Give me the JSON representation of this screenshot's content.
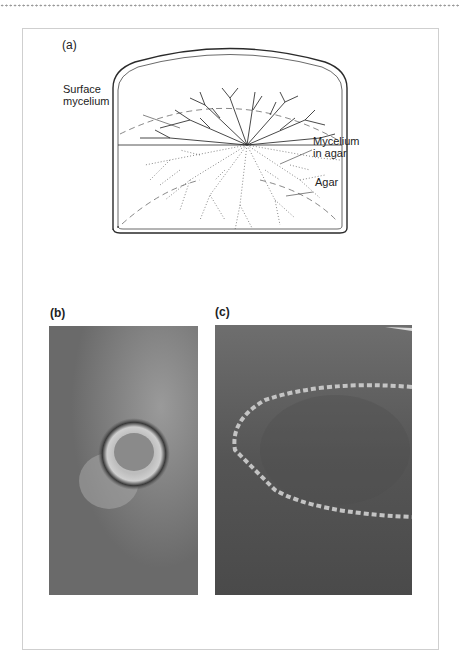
{
  "page": {
    "top_rule": "dotted"
  },
  "figure": {
    "panel_a": {
      "label": "(a)",
      "callouts": {
        "surface_mycelium_line1": "Surface",
        "surface_mycelium_line2": "mycelium",
        "mycelium_in_agar_line1": "Mycelium",
        "mycelium_in_agar_line2": "in agar",
        "agar": "Agar"
      }
    },
    "panel_b": {
      "label": "(b)",
      "image_description": "Photograph of a fungal colony spreading in a ring on a grey surface"
    },
    "panel_c": {
      "label": "(c)",
      "image_description": "Photograph of a fairy ring of mushrooms on a grass lawn"
    }
  },
  "colors": {
    "frame_border": "#cfcfcf",
    "line_art": "#2a2a2a",
    "photo_grey_b": "#707070",
    "photo_grey_c": "#5a5a5a"
  }
}
